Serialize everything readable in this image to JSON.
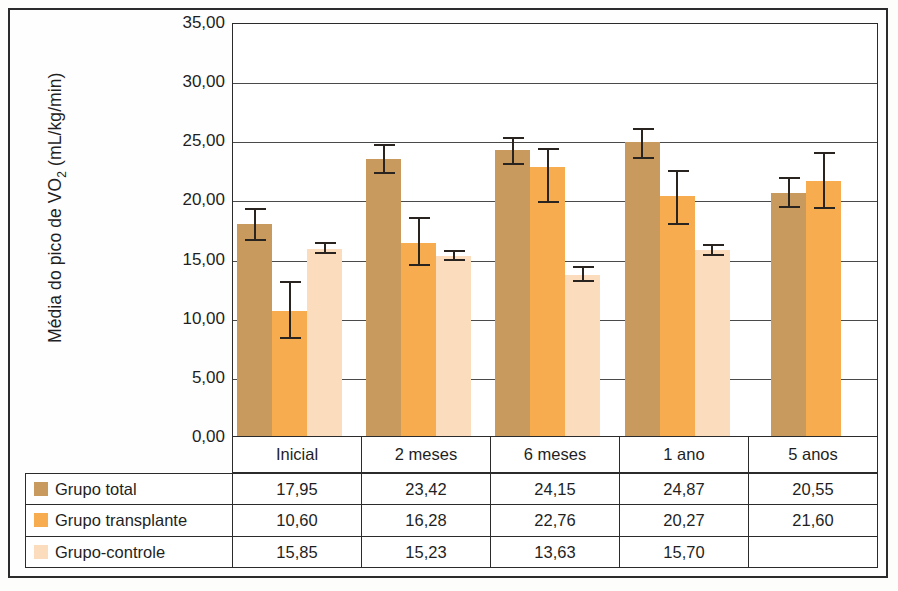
{
  "chart_data": {
    "type": "bar",
    "title": "",
    "subtitle": "",
    "xlabel": "",
    "ylabel": "Média do pico de VO2 (mL/kg/min)",
    "ylabel_parts": {
      "before": "Média do pico de VO",
      "sub": "2",
      "after": " (mL/kg/min)"
    },
    "categories": [
      "Inicial",
      "2 meses",
      "6 meses",
      "1 ano",
      "5 anos"
    ],
    "ylim": [
      0,
      35
    ],
    "ytick_step": 5,
    "ytick_labels": [
      "0,00",
      "5,00",
      "10,00",
      "15,00",
      "20,00",
      "25,00",
      "30,00",
      "35,00"
    ],
    "ytick_values": [
      0,
      5,
      10,
      15,
      20,
      25,
      30,
      35
    ],
    "grid": true,
    "grid_axis": "y",
    "legend_position": "table-below",
    "error_bars": true,
    "series": [
      {
        "name": "Grupo total",
        "color": "#c99a5e",
        "values": [
          17.95,
          23.42,
          24.15,
          24.87,
          20.55
        ],
        "labels": [
          "17,95",
          "23,42",
          "24,15",
          "24,87",
          "20,55"
        ],
        "err_low": [
          1.45,
          1.25,
          1.2,
          1.45,
          1.3
        ],
        "err_high": [
          1.35,
          1.3,
          1.15,
          1.15,
          1.35
        ]
      },
      {
        "name": "Grupo transplante",
        "color": "#f7ac4f",
        "values": [
          10.6,
          16.28,
          22.76,
          20.27,
          21.6
        ],
        "labels": [
          "10,60",
          "16,28",
          "22,76",
          "20,27",
          "21,60"
        ],
        "err_low": [
          2.4,
          1.9,
          3.1,
          2.4,
          2.4
        ],
        "err_high": [
          2.5,
          2.2,
          1.6,
          2.2,
          2.4
        ]
      },
      {
        "name": "Grupo-controle",
        "color": "#fbdcbc",
        "values": [
          15.85,
          15.23,
          13.63,
          15.7,
          null
        ],
        "labels": [
          "15,85",
          "15,23",
          "13,63",
          "15,70",
          ""
        ],
        "err_low": [
          0.45,
          0.45,
          0.6,
          0.45,
          null
        ],
        "err_high": [
          0.55,
          0.5,
          0.7,
          0.5,
          null
        ]
      }
    ]
  },
  "table": {
    "row_labels": [
      "Grupo total",
      "Grupo transplante",
      "Grupo-controle"
    ],
    "column_headers": [
      "Inicial",
      "2 meses",
      "6 meses",
      "1 ano",
      "5 anos"
    ],
    "rows": [
      [
        "17,95",
        "23,42",
        "24,15",
        "24,87",
        "20,55"
      ],
      [
        "10,60",
        "16,28",
        "22,76",
        "20,27",
        "21,60"
      ],
      [
        "15,85",
        "15,23",
        "13,63",
        "15,70",
        ""
      ]
    ]
  },
  "colors": {
    "series1": "#c99a5e",
    "series2": "#f7ac4f",
    "series3": "#fbdcbc",
    "axis": "#2b2b2b",
    "grid": "#4a4a4a",
    "error_bar": "#2a2420",
    "background": "#ffffff"
  }
}
